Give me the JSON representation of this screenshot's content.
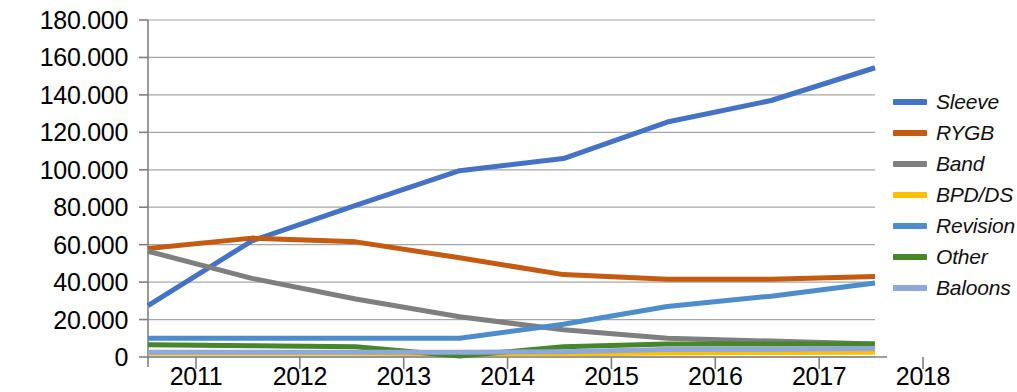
{
  "chart_data": {
    "type": "line",
    "title": "",
    "subtitle": "",
    "xlabel": "",
    "ylabel": "",
    "x": [
      2011,
      2012,
      2013,
      2014,
      2015,
      2016,
      2017,
      2018
    ],
    "categories": [
      "2011",
      "2012",
      "2013",
      "2014",
      "2015",
      "2016",
      "2017",
      "2018"
    ],
    "xtick_labels": [
      "2011",
      "2012",
      "2013",
      "2014",
      "2015",
      "2016",
      "2017",
      "2018"
    ],
    "ytick_labels": [
      "0",
      "20.000",
      "40.000",
      "60.000",
      "80.000",
      "100.000",
      "120.000",
      "140.000",
      "160.000",
      "180.000"
    ],
    "ytick_values": [
      0,
      20000,
      40000,
      60000,
      80000,
      100000,
      120000,
      140000,
      160000,
      180000
    ],
    "ylim": [
      0,
      180000
    ],
    "xlim": [
      2011,
      2018
    ],
    "grid": "horizontal",
    "legend_position": "right",
    "series": [
      {
        "name": "Sleeve",
        "color": "#4472C4",
        "values": [
          27500,
          62000,
          81000,
          99500,
          106000,
          125500,
          137000,
          154500
        ]
      },
      {
        "name": "RYGB",
        "color": "#C55A11",
        "values": [
          58000,
          63500,
          61500,
          53000,
          44000,
          41500,
          41500,
          43000
        ]
      },
      {
        "name": "Band",
        "color": "#7F7F7F",
        "values": [
          56500,
          42000,
          31000,
          21500,
          14500,
          10000,
          8500,
          7000
        ]
      },
      {
        "name": "BPD/DS",
        "color": "#FFC000",
        "values": [
          2000,
          2000,
          2000,
          1800,
          1800,
          2200,
          2400,
          2500
        ]
      },
      {
        "name": "Revision",
        "color": "#4E8DCB",
        "values": [
          10000,
          10000,
          10000,
          10000,
          17500,
          27000,
          32500,
          39500
        ]
      },
      {
        "name": "Other",
        "color": "#47862B",
        "values": [
          6500,
          6000,
          5500,
          500,
          5500,
          7000,
          7000,
          7000
        ]
      },
      {
        "name": "Baloons",
        "color": "#8FA8DB",
        "values": [
          2500,
          2500,
          2500,
          2500,
          2800,
          4000,
          4200,
          4500
        ]
      }
    ]
  },
  "legend": {
    "items": [
      {
        "label": "Sleeve",
        "color": "#4472C4"
      },
      {
        "label": "RYGB",
        "color": "#C55A11"
      },
      {
        "label": "Band",
        "color": "#7F7F7F"
      },
      {
        "label": "BPD/DS",
        "color": "#FFC000"
      },
      {
        "label": "Revision",
        "color": "#4E8DCB"
      },
      {
        "label": "Other",
        "color": "#47862B"
      },
      {
        "label": "Baloons",
        "color": "#8FA8DB"
      }
    ]
  },
  "colors": {
    "grid": "#A6A6A6",
    "axis": "#808080",
    "text": "#000000",
    "background": "#FFFFFF"
  }
}
